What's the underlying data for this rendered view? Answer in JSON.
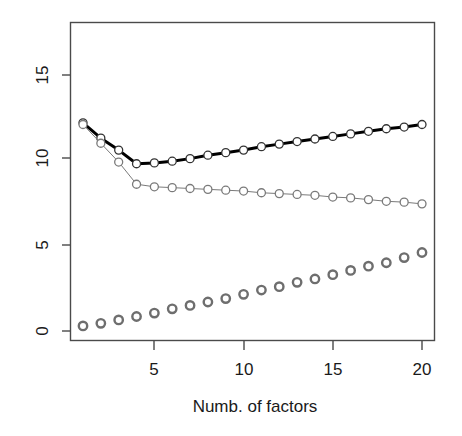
{
  "chart_data": {
    "type": "line",
    "title": "",
    "subtitle": "",
    "xlabel": "Numb. of factors",
    "ylabel": "",
    "x": [
      1,
      2,
      3,
      4,
      5,
      6,
      7,
      8,
      9,
      10,
      11,
      12,
      13,
      14,
      15,
      16,
      17,
      18,
      19,
      20
    ],
    "xlim": [
      0.3,
      20.7
    ],
    "ylim": [
      -0.6,
      18.0
    ],
    "xticks": [
      5,
      10,
      15,
      20
    ],
    "xtick_labels": [
      "5",
      "10",
      "15",
      "20"
    ],
    "yticks": [
      0,
      5,
      10,
      15
    ],
    "ytick_labels": [
      "0",
      "5",
      "10",
      "15"
    ],
    "grid": false,
    "legend": "none",
    "box": true,
    "series": [
      {
        "name": "upper-black-series",
        "style": "line-with-circles",
        "color": "#000000",
        "line_width": 3,
        "marker": "open-circle",
        "values": [
          12.2,
          11.3,
          10.6,
          9.8,
          9.85,
          9.95,
          10.1,
          10.3,
          10.45,
          10.6,
          10.8,
          10.95,
          11.1,
          11.25,
          11.4,
          11.55,
          11.7,
          11.85,
          11.95,
          12.1
        ]
      },
      {
        "name": "middle-gray-series",
        "style": "line-with-circles",
        "color": "#7a7a7a",
        "line_width": 1,
        "marker": "open-circle",
        "values": [
          12.1,
          11.0,
          9.9,
          8.6,
          8.45,
          8.4,
          8.35,
          8.3,
          8.25,
          8.2,
          8.1,
          8.05,
          8.0,
          7.95,
          7.85,
          7.8,
          7.7,
          7.6,
          7.55,
          7.45
        ]
      },
      {
        "name": "lower-gray-points-series",
        "style": "points-only",
        "color": "#6e6e6e",
        "line_width": 0,
        "marker": "open-circle",
        "values": [
          0.3,
          0.45,
          0.65,
          0.85,
          1.05,
          1.3,
          1.5,
          1.7,
          1.9,
          2.15,
          2.4,
          2.6,
          2.85,
          3.05,
          3.3,
          3.55,
          3.8,
          4.0,
          4.3,
          4.6
        ]
      }
    ]
  },
  "axes": {
    "x_axis_label": "Numb. of factors",
    "x_tick_0": "5",
    "x_tick_1": "10",
    "x_tick_2": "15",
    "x_tick_3": "20",
    "y_tick_0": "0",
    "y_tick_1": "5",
    "y_tick_2": "10",
    "y_tick_3": "15"
  },
  "colors": {
    "background": "#ffffff",
    "axis": "#4a4a4a",
    "text": "#1a1a1a",
    "series_black": "#000000",
    "series_gray": "#7a7a7a",
    "series_gray_points": "#6e6e6e"
  }
}
